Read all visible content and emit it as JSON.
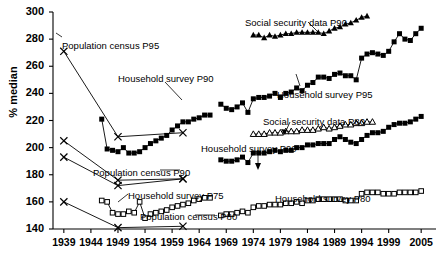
{
  "chart_data": {
    "type": "line",
    "title": "",
    "xlabel": "",
    "ylabel": "% median",
    "xlim": [
      1937,
      2007
    ],
    "ylim": [
      140,
      300
    ],
    "ytick_labels": [
      "140",
      "160",
      "180",
      "200",
      "220",
      "240",
      "260",
      "280",
      "300"
    ],
    "ytick_values": [
      140,
      160,
      180,
      200,
      220,
      240,
      260,
      280,
      300
    ],
    "xtick_labels": [
      "1939",
      "1944",
      "1949",
      "1954",
      "1959",
      "1964",
      "1969",
      "1974",
      "1979",
      "1984",
      "1989",
      "1994",
      "1999",
      "2005"
    ],
    "xtick_values": [
      1939,
      1944,
      1949,
      1954,
      1959,
      1964,
      1969,
      1974,
      1979,
      1984,
      1989,
      1994,
      1999,
      2005
    ],
    "grid": false,
    "legend_position": "inline-annotations",
    "series": [
      {
        "name": "Population census P95",
        "marker": "x",
        "x": [
          1939,
          1949,
          1961
        ],
        "values": [
          271,
          208,
          211
        ]
      },
      {
        "name": "Population census P90",
        "marker": "x",
        "x": [
          1939,
          1949,
          1961
        ],
        "values": [
          205,
          176,
          177
        ]
      },
      {
        "name": "Population census P90b",
        "marker": "x",
        "x": [
          1939,
          1949,
          1961
        ],
        "values": [
          193,
          172,
          177
        ]
      },
      {
        "name": "Population census P80",
        "marker": "x",
        "x": [
          1939,
          1949,
          1961
        ],
        "values": [
          160,
          141,
          142
        ]
      },
      {
        "name": "Household survey P90",
        "marker": "filled-square",
        "x": [
          1946,
          1947,
          1948,
          1949,
          1950,
          1951,
          1952,
          1953,
          1954,
          1955,
          1956,
          1957,
          1958,
          1959,
          1960,
          1961,
          1962,
          1963,
          1964,
          1965,
          1966
        ],
        "values": [
          221,
          199,
          198,
          197,
          200,
          196,
          196,
          197,
          200,
          203,
          205,
          207,
          209,
          213,
          216,
          219,
          219,
          221,
          222,
          224,
          224
        ]
      },
      {
        "name": "Household survey P90 (later)",
        "marker": "filled-square",
        "x": [
          1968,
          1969,
          1970,
          1971,
          1972,
          1973,
          1974,
          1975,
          1976,
          1977,
          1978,
          1979,
          1980,
          1981,
          1982,
          1983,
          1984,
          1985,
          1986,
          1987,
          1988,
          1989,
          1990,
          1991,
          1992,
          1993,
          1994,
          1995,
          1996,
          1997,
          1998,
          1999,
          2000,
          2001,
          2002,
          2003,
          2004,
          2005
        ],
        "values": [
          191,
          190,
          190,
          191,
          193,
          189,
          196,
          196,
          196,
          197,
          198,
          197,
          198,
          198,
          200,
          200,
          202,
          202,
          203,
          203,
          203,
          206,
          208,
          206,
          204,
          203,
          206,
          209,
          211,
          211,
          212,
          215,
          217,
          218,
          218,
          219,
          221,
          223
        ]
      },
      {
        "name": "Household survey P95",
        "marker": "filled-square",
        "x": [
          1968,
          1969,
          1970,
          1971,
          1972,
          1973,
          1974,
          1975,
          1976,
          1977,
          1978,
          1979,
          1980,
          1981,
          1982,
          1983,
          1984,
          1985,
          1986,
          1987,
          1988,
          1989,
          1990,
          1991,
          1992,
          1993,
          1994,
          1995,
          1996,
          1997,
          1998,
          1999,
          2000,
          2001,
          2002,
          2003,
          2004,
          2005
        ],
        "values": [
          232,
          229,
          228,
          230,
          233,
          226,
          236,
          237,
          237,
          238,
          240,
          237,
          240,
          241,
          244,
          242,
          246,
          248,
          252,
          252,
          251,
          254,
          255,
          253,
          253,
          250,
          266,
          269,
          270,
          269,
          268,
          271,
          278,
          284,
          280,
          279,
          284,
          288
        ]
      },
      {
        "name": "Household survey P80",
        "marker": "open-square",
        "x": [
          1968,
          1969,
          1970,
          1971,
          1972,
          1973,
          1974,
          1975,
          1976,
          1977,
          1978,
          1979,
          1980,
          1981,
          1982,
          1983,
          1984,
          1985,
          1986,
          1987,
          1988,
          1989,
          1990,
          1991,
          1992,
          1993,
          1994,
          1995,
          1996,
          1997,
          1998,
          1999,
          2000,
          2001,
          2002,
          2003,
          2004,
          2005
        ],
        "values": [
          150,
          151,
          151,
          152,
          153,
          152,
          156,
          157,
          157,
          158,
          158,
          158,
          159,
          159,
          160,
          159,
          161,
          161,
          162,
          162,
          162,
          162,
          162,
          161,
          161,
          161,
          166,
          167,
          167,
          167,
          166,
          166,
          166,
          167,
          167,
          167,
          167,
          168
        ]
      },
      {
        "name": "Household survey P75",
        "marker": "open-square",
        "x": [
          1946,
          1947,
          1948,
          1949,
          1950,
          1951,
          1952,
          1953,
          1954,
          1955,
          1956,
          1957,
          1958,
          1959,
          1960,
          1961,
          1962,
          1963,
          1964,
          1965,
          1966
        ],
        "values": [
          161,
          160,
          152,
          151,
          151,
          153,
          152,
          160,
          148,
          151,
          152,
          153,
          154,
          156,
          157,
          158,
          159,
          161,
          162,
          163,
          163
        ]
      },
      {
        "name": "Social security data P90",
        "marker": "filled-triangle",
        "x": [
          1974,
          1975,
          1976,
          1977,
          1978,
          1979,
          1980,
          1981,
          1982,
          1983,
          1984,
          1985,
          1986,
          1987,
          1988,
          1989,
          1990,
          1991,
          1992,
          1993,
          1994,
          1995
        ],
        "values": [
          283,
          283,
          281,
          283,
          282,
          283,
          284,
          284,
          285,
          285,
          285,
          285,
          285,
          284,
          286,
          288,
          289,
          291,
          292,
          294,
          296,
          297
        ]
      },
      {
        "name": "Social security data P80",
        "marker": "open-triangle",
        "x": [
          1974,
          1975,
          1976,
          1977,
          1978,
          1979,
          1980,
          1981,
          1982,
          1983,
          1984,
          1985,
          1986,
          1987,
          1988,
          1989,
          1990,
          1991,
          1992,
          1993,
          1994,
          1995,
          1996
        ],
        "values": [
          210,
          210,
          210,
          211,
          211,
          211,
          212,
          212,
          212,
          213,
          213,
          213,
          214,
          215,
          214,
          215,
          216,
          217,
          217,
          218,
          218,
          219,
          219
        ]
      }
    ],
    "annotations": [
      {
        "id": "pop-census-p95",
        "text": "Population census P95",
        "x": 62,
        "y": 40
      },
      {
        "id": "household-survey-p90-top",
        "text": "Household survey P90",
        "x": 118,
        "y": 73
      },
      {
        "id": "social-security-p90",
        "text": "Social security data P90",
        "x": 245,
        "y": 17
      },
      {
        "id": "household-survey-p95",
        "text": "Household survey P95",
        "x": 277,
        "y": 89
      },
      {
        "id": "social-security-p80",
        "text": "Social security data P80",
        "x": 263,
        "y": 116
      },
      {
        "id": "household-survey-p90-mid",
        "text": "Household survey P90",
        "x": 201,
        "y": 143
      },
      {
        "id": "pop-census-p90",
        "text": "Population census P90",
        "x": 93,
        "y": 167
      },
      {
        "id": "household-survey-p75",
        "text": "Household survey P75",
        "x": 128,
        "y": 190
      },
      {
        "id": "household-survey-p80",
        "text": "Household survey P80",
        "x": 275,
        "y": 193
      },
      {
        "id": "pop-census-p80",
        "text": "Population census P80",
        "x": 140,
        "y": 211
      }
    ]
  }
}
